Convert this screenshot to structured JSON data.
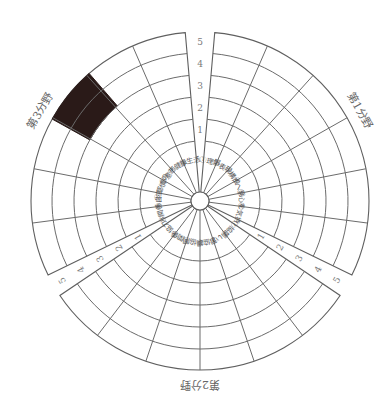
{
  "diagram": {
    "type": "polar-sector-rating-chart",
    "center": [
      200,
      201
    ],
    "hub_radius": 9,
    "ring_radii": [
      60,
      82,
      104,
      126,
      148,
      169
    ],
    "scale_labels": [
      "1",
      "2",
      "3",
      "4",
      "5"
    ],
    "colors": {
      "line": "#6b6b6b",
      "filled_cell": "#2a1a18",
      "text": "#5a5a5a",
      "background": "#ffffff"
    },
    "fields": [
      {
        "id": "field-1",
        "title": "第1分野",
        "start_deg": -85,
        "end_deg": 26,
        "items": [
          "①理解",
          "②表現",
          "③構成",
          "④へ発",
          "⑤心を",
          "⑥気持"
        ],
        "sub_note": "1 2"
      },
      {
        "id": "field-2",
        "title": "第2分野",
        "start_deg": 34,
        "end_deg": 146,
        "items": [
          "⑦協調",
          "⑧い習",
          "⑨協調",
          "⑩協同",
          "⑪関係",
          "⑫協力"
        ]
      },
      {
        "id": "field-3",
        "title": "第3分野",
        "start_deg": 154,
        "end_deg": 265,
        "items": [
          "⑬関係",
          "⑭自立",
          "⑮感情の",
          "⑯意志",
          "⑰健康",
          "⑱生活"
        ]
      }
    ],
    "filled_cells": [
      {
        "field": "field-3",
        "segment_start_deg": 209,
        "segment_end_deg": 229,
        "ring_from": 3,
        "ring_to": 5
      }
    ],
    "scale_positions": {
      "top_gap_deg": -90,
      "right_gap_deg": 30,
      "left_gap_deg": 150
    }
  }
}
